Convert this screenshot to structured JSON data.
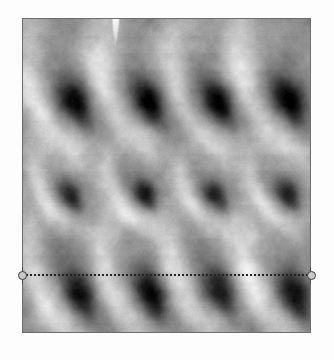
{
  "image": {
    "kind": "afm-topography-scan",
    "title": "AFM topography scan",
    "frame": {
      "x": 22,
      "y": 18,
      "width": 289,
      "height": 315
    },
    "background_color": "#ffffff",
    "frame_border_color": "#6d6d6d",
    "surface_base_color": "#8b8b8b",
    "surface_dark_color": "#141414",
    "surface_light_color": "#ededed",
    "colormap": "grayscale",
    "rows": 3,
    "columns": 4,
    "feature_shape": "teardrop-indentation",
    "features": [
      {
        "row": 1,
        "col": 1,
        "cx": 52,
        "cy": 84,
        "rx": 19,
        "ry": 32,
        "angle": -24,
        "depth": 0.97
      },
      {
        "row": 1,
        "col": 2,
        "cx": 125,
        "cy": 82,
        "rx": 19,
        "ry": 32,
        "angle": -24,
        "depth": 0.97
      },
      {
        "row": 1,
        "col": 3,
        "cx": 196,
        "cy": 84,
        "rx": 18,
        "ry": 30,
        "angle": -24,
        "depth": 0.94
      },
      {
        "row": 1,
        "col": 4,
        "cx": 268,
        "cy": 82,
        "rx": 19,
        "ry": 33,
        "angle": -24,
        "depth": 0.98
      },
      {
        "row": 2,
        "col": 1,
        "cx": 48,
        "cy": 178,
        "rx": 13,
        "ry": 20,
        "angle": -30,
        "depth": 0.8
      },
      {
        "row": 2,
        "col": 2,
        "cx": 122,
        "cy": 176,
        "rx": 14,
        "ry": 21,
        "angle": -30,
        "depth": 0.82
      },
      {
        "row": 2,
        "col": 3,
        "cx": 194,
        "cy": 178,
        "rx": 13,
        "ry": 20,
        "angle": -30,
        "depth": 0.78
      },
      {
        "row": 2,
        "col": 4,
        "cx": 266,
        "cy": 176,
        "rx": 14,
        "ry": 21,
        "angle": -30,
        "depth": 0.8
      },
      {
        "row": 3,
        "col": 1,
        "cx": 56,
        "cy": 276,
        "rx": 19,
        "ry": 33,
        "angle": -22,
        "depth": 0.97
      },
      {
        "row": 3,
        "col": 2,
        "cx": 128,
        "cy": 276,
        "rx": 19,
        "ry": 33,
        "angle": -22,
        "depth": 0.97
      },
      {
        "row": 3,
        "col": 3,
        "cx": 198,
        "cy": 274,
        "rx": 19,
        "ry": 32,
        "angle": -22,
        "depth": 0.95
      },
      {
        "row": 3,
        "col": 4,
        "cx": 272,
        "cy": 276,
        "rx": 19,
        "ry": 33,
        "angle": -22,
        "depth": 0.97
      }
    ],
    "artifact_streak": {
      "x": 113,
      "y": 18,
      "width": 5,
      "height": 28,
      "color": "#f2f2f2"
    }
  },
  "profile_line": {
    "name": "cross-section-profile-line",
    "orientation": "horizontal",
    "y": 275,
    "x_start": 22,
    "x_end": 311,
    "length_px": 289,
    "style": "dotted",
    "color": "#242424",
    "dot_size_px": 2,
    "dot_gap_px": 2,
    "handles": [
      {
        "id": "left",
        "x": 22,
        "y": 275,
        "shape": "circle",
        "diameter_px": 9
      },
      {
        "id": "right",
        "x": 311,
        "y": 275,
        "shape": "circle",
        "diameter_px": 9
      }
    ]
  },
  "labels": {
    "scan_area": "Scan area",
    "profile_line": "Cross-section line",
    "handle_left": "Left endpoint handle",
    "handle_right": "Right endpoint handle"
  }
}
